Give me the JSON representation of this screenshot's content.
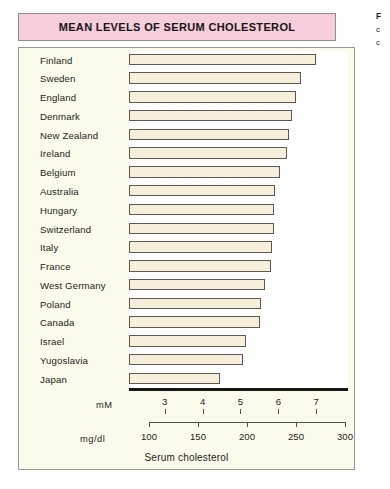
{
  "figure": {
    "title": "MEAN LEVELS OF SERUM CHOLESTEROL",
    "caption": "Serum cholesterol",
    "axis_primary_name": "mM",
    "axis_secondary_name": "mg/dl",
    "colors": {
      "title_banner": "#f6cddb",
      "panel_background": "#fbfbeb",
      "plot_background": "#ffffff",
      "bar_fill": "#f7eedc",
      "bar_border": "#5d5950",
      "baseline": "#181715",
      "text": "#1d1b19"
    }
  },
  "margin_note": {
    "line1": "F",
    "line2": "c",
    "line3": "c"
  },
  "chart_data": {
    "type": "bar",
    "orientation": "horizontal",
    "title": "MEAN LEVELS OF SERUM CHOLESTEROL",
    "xlabel": "Serum cholesterol",
    "ylabel": "",
    "categories": [
      "Finland",
      "Sweden",
      "England",
      "Denmark",
      "New Zealand",
      "Ireland",
      "Belgium",
      "Australia",
      "Hungary",
      "Switzerland",
      "Italy",
      "France",
      "West Germany",
      "Poland",
      "Canada",
      "Israel",
      "Yugoslavia",
      "Japan"
    ],
    "values": [
      270,
      255,
      250,
      246,
      243,
      241,
      234,
      229,
      228,
      228,
      226,
      224,
      218,
      214,
      213,
      199,
      196,
      172
    ],
    "value_unit": "mg/dl",
    "values_mM": [
      6.98,
      6.59,
      6.46,
      6.36,
      6.28,
      6.23,
      6.05,
      5.92,
      5.89,
      5.89,
      5.84,
      5.79,
      5.64,
      5.53,
      5.51,
      5.14,
      5.07,
      4.45
    ],
    "xlim": [
      100,
      300
    ],
    "axes": [
      {
        "name": "mM",
        "ticks": [
          3,
          4,
          5,
          6,
          7
        ],
        "tick_labels": [
          "3",
          "4",
          "5",
          "6",
          "7"
        ],
        "range": [
          2.58,
          7.75
        ]
      },
      {
        "name": "mg/dl",
        "ticks": [
          100,
          150,
          200,
          250,
          300
        ],
        "tick_labels": [
          "100",
          "150",
          "200",
          "250",
          "300"
        ],
        "range": [
          100,
          300
        ]
      }
    ],
    "grid": false,
    "legend": null
  }
}
